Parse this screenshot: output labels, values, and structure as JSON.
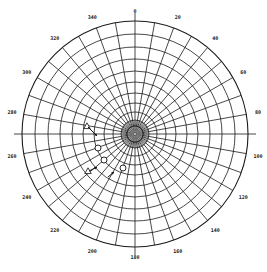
{
  "chart_data": {
    "type": "polar",
    "title": "",
    "center": [
      135,
      134
    ],
    "outer_radius": 113,
    "angular_ticks": [
      0,
      20,
      40,
      60,
      80,
      100,
      120,
      140,
      160,
      180,
      200,
      220,
      240,
      260,
      280,
      300,
      320,
      340
    ],
    "angular_labels": [
      "0",
      "20",
      "40",
      "60",
      "80",
      "100",
      "120",
      "140",
      "160",
      "180",
      "200",
      "220",
      "240",
      "260",
      "280",
      "300",
      "320",
      "340"
    ],
    "spoke_step_deg": 10,
    "ring_radii": [
      8,
      14,
      22,
      31,
      41,
      52,
      63,
      75,
      87,
      100,
      113
    ],
    "grid": true,
    "direction": "clockwise",
    "zero_location": "top",
    "colors": {
      "grid": "#1a1a1a",
      "background": "#ffffff"
    },
    "markers": [
      {
        "shape": "triangle-open",
        "x": 87,
        "y": 126
      },
      {
        "shape": "arrow",
        "x1": 88,
        "y1": 127,
        "x2": 97,
        "y2": 136
      },
      {
        "shape": "circle-open",
        "x": 98,
        "y": 148
      },
      {
        "shape": "circle-open",
        "x": 104,
        "y": 160
      },
      {
        "shape": "circle-open",
        "x": 123,
        "y": 168
      },
      {
        "shape": "triangle-open",
        "x": 88,
        "y": 171
      },
      {
        "shape": "arrow",
        "x1": 89,
        "y1": 171,
        "x2": 97,
        "y2": 167
      },
      {
        "shape": "arrow",
        "x1": 108,
        "y1": 177,
        "x2": 114,
        "y2": 172
      }
    ]
  }
}
